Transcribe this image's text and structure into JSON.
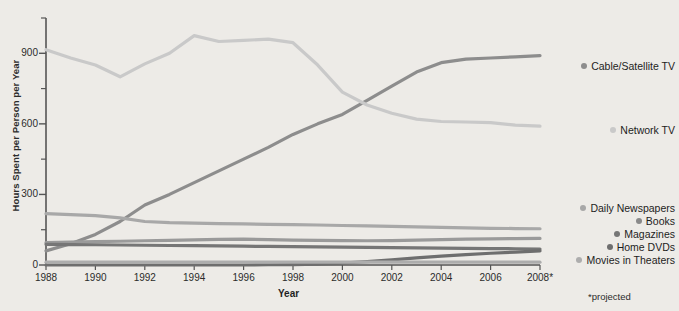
{
  "chart_data": {
    "type": "line",
    "title": "",
    "xlabel": "Year",
    "ylabel": "Hours Spent per Person per Year",
    "xlim": [
      1988,
      2008
    ],
    "ylim": [
      0,
      1050
    ],
    "yticks": [
      0,
      300,
      600,
      900
    ],
    "yticks_minor": [
      150,
      450,
      750,
      1050
    ],
    "xticks": [
      "1988",
      "1990",
      "1992",
      "1994",
      "1996",
      "1998",
      "2000",
      "2002",
      "2004",
      "2006",
      "2008*"
    ],
    "grid": false,
    "legend_position": "right",
    "footnote": "*projected",
    "x": [
      1988,
      1989,
      1990,
      1991,
      1992,
      1993,
      1994,
      1995,
      1996,
      1997,
      1998,
      1999,
      2000,
      2001,
      2002,
      2003,
      2004,
      2005,
      2006,
      2007,
      2008
    ],
    "series": [
      {
        "name": "Cable/Satellite TV",
        "color": "#8d8d8d",
        "values": [
          60,
          90,
          130,
          185,
          255,
          300,
          350,
          400,
          450,
          500,
          555,
          600,
          640,
          700,
          760,
          820,
          860,
          875,
          880,
          885,
          890
        ]
      },
      {
        "name": "Network TV",
        "color": "#c9c9c9",
        "values": [
          915,
          880,
          850,
          800,
          855,
          900,
          975,
          950,
          955,
          960,
          945,
          850,
          735,
          680,
          645,
          620,
          610,
          608,
          605,
          595,
          590
        ]
      },
      {
        "name": "Daily Newspapers",
        "color": "#a8a8a8",
        "values": [
          218,
          214,
          210,
          200,
          185,
          180,
          178,
          176,
          175,
          173,
          172,
          170,
          168,
          166,
          164,
          162,
          160,
          158,
          156,
          155,
          154
        ]
      },
      {
        "name": "Books",
        "color": "#9a9a9a",
        "values": [
          95,
          97,
          99,
          101,
          103,
          105,
          107,
          109,
          110,
          108,
          106,
          105,
          104,
          103,
          104,
          106,
          108,
          110,
          111,
          112,
          113
        ]
      },
      {
        "name": "Magazines",
        "color": "#767676",
        "values": [
          88,
          87,
          86,
          85,
          84,
          83,
          82,
          81,
          80,
          79,
          78,
          77,
          76,
          75,
          74,
          73,
          72,
          71,
          70,
          69,
          68
        ]
      },
      {
        "name": "Home DVDs",
        "color": "#6e6e6e",
        "values": [
          0,
          0,
          0,
          0,
          0,
          0,
          0,
          0,
          0,
          1,
          2,
          4,
          8,
          14,
          22,
          30,
          38,
          44,
          50,
          55,
          60
        ]
      },
      {
        "name": "Movies in Theaters",
        "color": "#adadad",
        "values": [
          12,
          12,
          12,
          12,
          12,
          12,
          12,
          12,
          12,
          12,
          12,
          12,
          12,
          12,
          12,
          12,
          12,
          12,
          12,
          12,
          12
        ]
      }
    ],
    "legend": [
      {
        "label": "Cable/Satellite TV",
        "color": "#8d8d8d"
      },
      {
        "label": "Network TV",
        "color": "#c9c9c9"
      },
      {
        "label": "Daily Newspapers",
        "color": "#a8a8a8"
      },
      {
        "label": "Books",
        "color": "#8a8a8a"
      },
      {
        "label": "Magazines",
        "color": "#767676"
      },
      {
        "label": "Home DVDs",
        "color": "#6e6e6e"
      },
      {
        "label": "Movies in Theaters",
        "color": "#adadad"
      }
    ]
  },
  "axis_color": "#555555"
}
